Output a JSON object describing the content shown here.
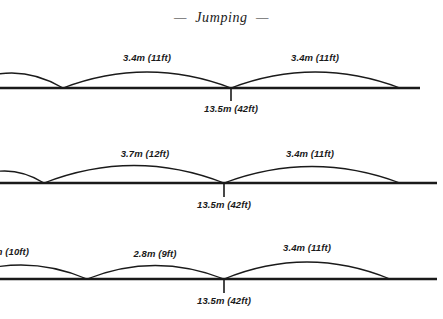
{
  "title": "—  Jumping  —",
  "diagram": {
    "type": "jump-trajectory-diagram",
    "rows": [
      {
        "id": "row-1",
        "baseline_y": 88,
        "baseline_x_start": 0,
        "baseline_x_end": 420,
        "arcs": [
          {
            "x_start": -40,
            "x_end": 63,
            "apex_label": "",
            "peak_height": 22
          },
          {
            "x_start": 63,
            "x_end": 231,
            "apex_label": "3.4m (11ft)",
            "peak_height": 24
          },
          {
            "x_start": 231,
            "x_end": 400,
            "apex_label": "3.4m (11ft)",
            "peak_height": 24
          }
        ],
        "edge_label": ")",
        "tick": {
          "x": 231,
          "label": "13.5m (42ft)"
        }
      },
      {
        "id": "row-2",
        "baseline_y": 183,
        "baseline_x_start": 0,
        "baseline_x_end": 437,
        "arcs": [
          {
            "x_start": -35,
            "x_end": 44,
            "apex_label": "",
            "peak_height": 18
          },
          {
            "x_start": 44,
            "x_end": 224,
            "apex_label": "3.7m (12ft)",
            "peak_height": 27
          },
          {
            "x_start": 224,
            "x_end": 400,
            "apex_label": "3.4m (11ft)",
            "peak_height": 25
          }
        ],
        "edge_label": "",
        "tick": {
          "x": 224,
          "label": "13.5m (42ft)"
        }
      },
      {
        "id": "row-3",
        "baseline_y": 279,
        "baseline_x_start": 0,
        "baseline_x_end": 437,
        "arcs": [
          {
            "x_start": -45,
            "x_end": 87,
            "apex_label": "",
            "peak_height": 20
          },
          {
            "x_start": 87,
            "x_end": 224,
            "apex_label": "2.8m (9ft)",
            "peak_height": 18
          },
          {
            "x_start": 224,
            "x_end": 390,
            "apex_label": "3.4m (11ft)",
            "peak_height": 26
          }
        ],
        "edge_label": "m (10ft)",
        "tick": {
          "x": 224,
          "label": "13.5m (42ft)"
        }
      }
    ],
    "labels": {
      "r1_arc2": "3.4m (11ft)",
      "r1_arc3": "3.4m (11ft)",
      "r1_tick": "13.5m (42ft)",
      "r1_edge": ")",
      "r2_arc2": "3.7m (12ft)",
      "r2_arc3": "3.4m (11ft)",
      "r2_tick": "13.5m (42ft)",
      "r3_edge": "m (10ft)",
      "r3_arc2": "2.8m (9ft)",
      "r3_arc3": "3.4m (11ft)",
      "r3_tick": "13.5m (42ft)"
    },
    "colors": {
      "ink": "#1a1a1a",
      "background": "#ffffff"
    }
  }
}
